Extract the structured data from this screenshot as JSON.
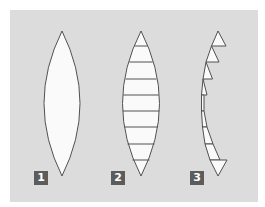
{
  "figure": {
    "colors": {
      "background": "#ffffff",
      "panel": "#dcdcdc",
      "lens_fill": "#fafafa",
      "stroke": "#505050",
      "label_bg": "#5c5c5c",
      "label_text": "#ffffff"
    },
    "panels": [
      {
        "id": "lens-1",
        "label": "1",
        "kind": "biconvex-lens"
      },
      {
        "id": "lens-2",
        "label": "2",
        "kind": "sliced-lens",
        "slice_count": 9
      },
      {
        "id": "lens-3",
        "label": "3",
        "kind": "fresnel-prisms",
        "segment_count": 9
      }
    ]
  }
}
